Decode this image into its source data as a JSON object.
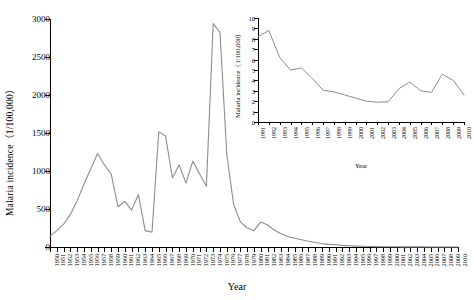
{
  "figure": {
    "background": "#ffffff",
    "line_color": "#8d8d8d",
    "axis_color": "#000000"
  },
  "chart_data": [
    {
      "id": "main",
      "type": "line",
      "title": "",
      "xlabel": "Year",
      "ylabel": "Malaria incidence（1/100,000）",
      "xlim": [
        1950,
        2010
      ],
      "ylim": [
        0,
        3000
      ],
      "yticks": [
        0,
        500,
        1000,
        1500,
        2000,
        2500,
        3000
      ],
      "grid": false,
      "legend": "none",
      "categories": [
        1950,
        1951,
        1952,
        1953,
        1954,
        1955,
        1956,
        1957,
        1958,
        1959,
        1960,
        1961,
        1962,
        1963,
        1964,
        1965,
        1966,
        1967,
        1968,
        1969,
        1970,
        1971,
        1972,
        1973,
        1974,
        1975,
        1976,
        1977,
        1978,
        1979,
        1980,
        1981,
        1982,
        1983,
        1984,
        1985,
        1986,
        1987,
        1988,
        1989,
        1990,
        1991,
        1992,
        1993,
        1994,
        1995,
        1996,
        1997,
        1998,
        1999,
        2000,
        2001,
        2002,
        2003,
        2004,
        2005,
        2006,
        2007,
        2008,
        2009,
        2010
      ],
      "values": [
        140,
        215,
        300,
        430,
        610,
        830,
        1030,
        1230,
        1080,
        960,
        530,
        600,
        485,
        690,
        215,
        195,
        1515,
        1460,
        910,
        1080,
        840,
        1130,
        960,
        800,
        2940,
        2820,
        1220,
        560,
        330,
        250,
        215,
        330,
        290,
        220,
        175,
        135,
        115,
        95,
        75,
        60,
        45,
        35,
        30,
        22,
        16,
        12,
        9,
        7,
        5,
        4,
        3,
        2.5,
        2,
        1.6,
        1.3,
        1,
        0.8,
        0.6,
        0.5,
        0.4,
        0.3
      ]
    },
    {
      "id": "inset",
      "type": "line",
      "title": "",
      "xlabel": "Year",
      "ylabel": "Malaria incidence（1/100,000）",
      "xlim": [
        1991,
        2010
      ],
      "ylim": [
        0,
        10
      ],
      "yticks": [
        0,
        1,
        2,
        3,
        4,
        5,
        6,
        7,
        8,
        9,
        10
      ],
      "grid": false,
      "legend": "none",
      "categories": [
        1991,
        1992,
        1993,
        1994,
        1995,
        1996,
        1997,
        1998,
        1999,
        2000,
        2001,
        2002,
        2003,
        2004,
        2005,
        2006,
        2007,
        2008,
        2009,
        2010
      ],
      "values": [
        8.2,
        8.8,
        6.2,
        5.0,
        5.2,
        4.2,
        3.05,
        2.9,
        2.6,
        2.3,
        2.0,
        1.9,
        1.95,
        3.2,
        3.85,
        3.0,
        2.85,
        4.6,
        4.0,
        2.6
      ]
    }
  ],
  "main_axis": {
    "ylabel": "Malaria incidence（1/100,000）",
    "xlabel": "Year",
    "ytick_labels": [
      "3000",
      "2500",
      "2000",
      "1500",
      "1000",
      "500",
      "0"
    ],
    "xtick_labels": [
      "1950",
      "1951",
      "1952",
      "1953",
      "1954",
      "1955",
      "1956",
      "1957",
      "1958",
      "1959",
      "1960",
      "1961",
      "1962",
      "1963",
      "1964",
      "1965",
      "1966",
      "1967",
      "1968",
      "1969",
      "1970",
      "1971",
      "1972",
      "1973",
      "1974",
      "1975",
      "1976",
      "1977",
      "1978",
      "1979",
      "1980",
      "1981",
      "1982",
      "1983",
      "1984",
      "1985",
      "1986",
      "1987",
      "1988",
      "1989",
      "1990",
      "1991",
      "1992",
      "1993",
      "1994",
      "1995",
      "1996",
      "1997",
      "1998",
      "1999",
      "2000",
      "2001",
      "2002",
      "2003",
      "2004",
      "2005",
      "2006",
      "2007",
      "2008",
      "2009",
      "2010"
    ]
  },
  "inset_axis": {
    "ylabel": "Malaria incidence（1/100,000）",
    "xlabel": "Year",
    "ytick_labels": [
      "10",
      "9",
      "8",
      "7",
      "6",
      "5",
      "4",
      "3",
      "2",
      "1",
      "0"
    ],
    "xtick_labels": [
      "1991",
      "1992",
      "1993",
      "1994",
      "1995",
      "1996",
      "1997",
      "1998",
      "1999",
      "2000",
      "2001",
      "2002",
      "2003",
      "2004",
      "2005",
      "2006",
      "2007",
      "2008",
      "2009",
      "2010"
    ]
  }
}
